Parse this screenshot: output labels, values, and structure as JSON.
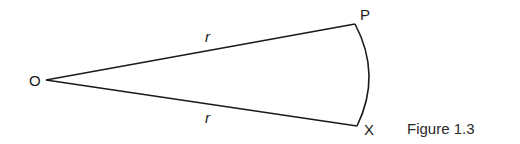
{
  "diagram": {
    "type": "sector",
    "points": {
      "O": {
        "label": "O",
        "x": 46,
        "y": 80
      },
      "P": {
        "label": "P",
        "x": 355,
        "y": 24
      },
      "X": {
        "label": "X",
        "x": 357,
        "y": 126
      }
    },
    "radius_labels": {
      "upper": "r",
      "lower": "r"
    },
    "caption": "Figure 1.3",
    "stroke_color": "#1a1a1a"
  }
}
